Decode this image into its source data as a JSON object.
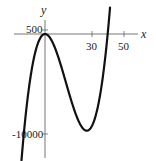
{
  "chart_data": {
    "type": "line",
    "title": "",
    "xlabel": "x",
    "ylabel": "y",
    "x_ticks": [
      30,
      50
    ],
    "y_ticks": [
      500,
      -10000
    ],
    "x_tick_labels": [
      "30",
      "50"
    ],
    "y_tick_labels": [
      "500",
      "-10000"
    ],
    "grid": false,
    "legend": null,
    "series": [
      {
        "name": "f(x)",
        "description": "Cubic with local maximum near (0, 0) and local minimum near (27, -9500); crosses x-axis near x = 40",
        "x": [
          -15,
          -10,
          -5,
          0,
          5,
          10,
          15,
          20,
          25,
          27,
          30,
          35,
          40,
          42
        ],
        "values": [
          -12375,
          -5000,
          -1125,
          0,
          -875,
          -3000,
          -5625,
          -8000,
          -9375,
          -9477,
          -9000,
          -6125,
          0,
          3528
        ]
      }
    ],
    "xlim": [
      -15,
      60
    ],
    "ylim": [
      -12500,
      1500
    ],
    "color": "#111111"
  },
  "labels": {
    "x_axis": "x",
    "y_axis": "y",
    "tick_500": "500",
    "tick_neg10000": "-10000",
    "tick_30": "30",
    "tick_50": "50"
  }
}
